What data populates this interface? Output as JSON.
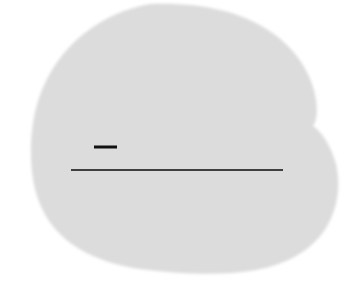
{
  "canvas": {
    "width": 364,
    "height": 282,
    "background_color": "#ffffff",
    "description": "Scanned document artifact: a large pale-gray irregular rounded blob with a concave notch on the right edge, overlaid by two black horizontal rule marks."
  },
  "figure": {
    "blob": {
      "name": "gray-blob",
      "fill_color": "#dcdcdc",
      "edge_softness_px": 2,
      "bounds": {
        "x_min": 31,
        "x_max": 337,
        "y_min": 4,
        "y_max": 272
      },
      "path": "M 150 4 C 196 2 238 10 268 30 C 296 48 312 74 316 100 C 318 114 316 122 313 126 C 322 132 331 146 336 164 C 341 186 338 208 326 228 C 312 250 288 264 256 270 C 222 276 182 274 148 270 C 112 266 80 254 60 234 C 40 214 32 188 31 158 C 30 126 36 96 52 70 C 70 40 104 12 150 4 Z",
      "notch": {
        "name": "right-edge-notch",
        "description": "concave pinch on the right contour",
        "x": 313,
        "y": 126
      }
    },
    "marks": [
      {
        "name": "short-dash-mark",
        "type": "thick-dash",
        "color": "#111111",
        "x1": 94,
        "x2": 117,
        "y": 147,
        "thickness": 3
      },
      {
        "name": "long-rule-mark",
        "type": "thin-rule",
        "color": "#1a1a1a",
        "x1": 71,
        "x2": 283,
        "y": 170,
        "thickness": 1.6
      }
    ]
  }
}
